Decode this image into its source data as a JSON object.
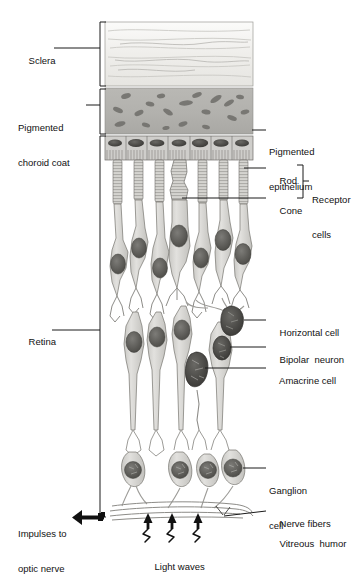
{
  "figure": {
    "colors": {
      "sclera_fill": "#f2f1ee",
      "choroid_fill": "#b4b3b0",
      "epithelium_fill": "#c8c7c4",
      "cell_fill": "#d9d8d5",
      "nucleus_dark": "#5a5955",
      "nucleus_darker": "#4a4845",
      "outline": "#555452",
      "leader": "#1a1a1a",
      "text": "#111111"
    }
  },
  "left_labels": [
    {
      "id": "sclera",
      "text": "Sclera",
      "x": 18,
      "y": 44
    },
    {
      "id": "pigmented-choroid-coat",
      "line1": "Pigmented",
      "line2": "choroid coat",
      "x": 18,
      "y": 101
    },
    {
      "id": "retina",
      "text": "Retina",
      "x": 18,
      "y": 325
    },
    {
      "id": "impulses-to-optic-nerve",
      "line1": "Impulses to",
      "line2": "optic nerve",
      "x": 18,
      "y": 506
    }
  ],
  "right_labels": [
    {
      "id": "pigmented-epithelium",
      "line1": "Pigmented",
      "line2": "epithelium",
      "x": 258,
      "y": 124
    },
    {
      "id": "rod",
      "text": "Rod",
      "x": 268,
      "y": 164
    },
    {
      "id": "cone",
      "text": "Cone",
      "x": 268,
      "y": 194
    },
    {
      "id": "receptor-cells",
      "line1": "Receptor",
      "line2": "cells",
      "x": 312,
      "y": 172
    },
    {
      "id": "horizontal-cell",
      "text": "Horizontal cell",
      "x": 268,
      "y": 316
    },
    {
      "id": "bipolar-neuron",
      "text": "Bipolar  neuron",
      "x": 268,
      "y": 343
    },
    {
      "id": "amacrine-cell",
      "text": "Amacrine cell",
      "x": 268,
      "y": 364
    },
    {
      "id": "ganglion-cell",
      "line1": "Ganglion",
      "line2": "cell",
      "x": 268,
      "y": 463
    },
    {
      "id": "nerve-fibers",
      "text": "Nerve fibers",
      "x": 268,
      "y": 507
    },
    {
      "id": "vitreous-humor",
      "text": "Vitreous  humor",
      "x": 268,
      "y": 527
    }
  ],
  "bottom_labels": [
    {
      "id": "light-waves",
      "text": "Light waves",
      "x": 145,
      "y": 551
    }
  ],
  "brackets": [
    {
      "id": "bracket-sclera",
      "x": 100,
      "top": 22,
      "bottom": 86
    },
    {
      "id": "bracket-choroid",
      "x": 100,
      "top": 89,
      "bottom": 134
    },
    {
      "id": "bracket-retina",
      "x": 100,
      "top": 136,
      "bottom": 517
    }
  ],
  "layers": {
    "sclera": {
      "x": 105,
      "y": 22,
      "w": 148,
      "h": 64
    },
    "choroid": {
      "x": 105,
      "y": 88,
      "w": 148,
      "h": 46
    },
    "epithelium": {
      "x": 105,
      "y": 136,
      "w": 148,
      "h": 24,
      "cell_count": 7
    }
  },
  "receptors": {
    "count": 7,
    "cone_index": 4,
    "x_positions": [
      117,
      138,
      159,
      180,
      202,
      223,
      243
    ]
  },
  "ganglion_cells": {
    "count": 4,
    "x_positions": [
      133,
      180,
      208,
      233
    ],
    "y": 470
  },
  "light_waves": {
    "count": 3,
    "x_positions": [
      148,
      172,
      198
    ],
    "arrow_top": 513,
    "arrow_bottom": 530
  }
}
